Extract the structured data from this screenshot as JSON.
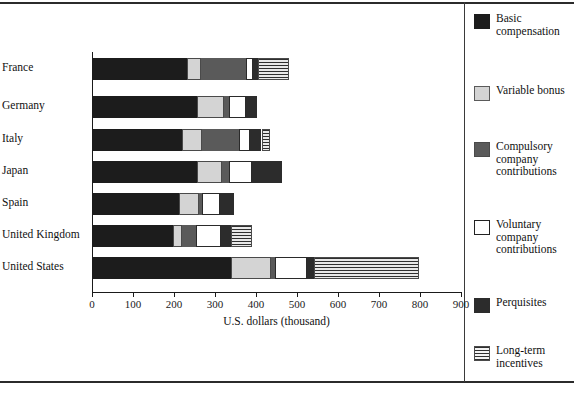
{
  "chart_data": {
    "type": "bar",
    "orientation": "horizontal",
    "stacked": true,
    "title": "",
    "xlabel": "U.S. dollars (thousand)",
    "ylabel": "",
    "xlim": [
      0,
      900
    ],
    "xticks": [
      0,
      100,
      200,
      300,
      400,
      500,
      600,
      700,
      800,
      900
    ],
    "grid": false,
    "legend_position": "right",
    "categories": [
      "France",
      "Germany",
      "Italy",
      "Japan",
      "Spain",
      "United Kingdom",
      "United States"
    ],
    "series": [
      {
        "name": "Basic compensation",
        "color": "#1c1c1c",
        "values": [
          230,
          254,
          218,
          254,
          210,
          196,
          337
        ]
      },
      {
        "name": "Variable bonus",
        "color": "#d4d4d4",
        "values": [
          34,
          66,
          49,
          61,
          49,
          22,
          98
        ]
      },
      {
        "name": "Compulsory company contributions",
        "color": "#5a5a5a",
        "values": [
          110,
          12,
          90,
          17,
          7,
          34,
          10
        ]
      },
      {
        "name": "Voluntary company contributions",
        "color": "#ffffff",
        "values": [
          17,
          42,
          25,
          57,
          44,
          61,
          76
        ]
      },
      {
        "name": "Perquisites",
        "color": "#2c2c2c",
        "values": [
          12,
          27,
          29,
          73,
          34,
          24,
          17
        ]
      },
      {
        "name": "Long-term incentives",
        "color": "#e8e8e8",
        "values": [
          76,
          0,
          20,
          0,
          0,
          52,
          257
        ]
      }
    ],
    "totals": [
      479,
      401,
      431,
      462,
      344,
      389,
      795
    ]
  },
  "axis": {
    "x_title": "U.S. dollars (thousand)",
    "tick_labels": [
      "0",
      "100",
      "200",
      "300",
      "400",
      "500",
      "600",
      "700",
      "800",
      "900"
    ]
  },
  "bars": [
    {
      "label": "France",
      "segments": [
        230,
        34,
        110,
        17,
        12,
        76
      ]
    },
    {
      "label": "Germany",
      "segments": [
        254,
        66,
        12,
        42,
        27,
        0
      ]
    },
    {
      "label": "Italy",
      "segments": [
        218,
        49,
        90,
        25,
        29,
        20
      ]
    },
    {
      "label": "Japan",
      "segments": [
        254,
        61,
        17,
        57,
        73,
        0
      ]
    },
    {
      "label": "Spain",
      "segments": [
        210,
        49,
        7,
        44,
        34,
        0
      ]
    },
    {
      "label": "United Kingdom",
      "segments": [
        196,
        22,
        34,
        61,
        24,
        52
      ]
    },
    {
      "label": "United States",
      "segments": [
        337,
        98,
        10,
        76,
        17,
        257
      ]
    }
  ],
  "legend": {
    "items": [
      {
        "label": "Basic compensation",
        "swatch": "basic",
        "color": "#1c1c1c"
      },
      {
        "label": "Variable bonus",
        "swatch": "bonus",
        "color": "#d4d4d4"
      },
      {
        "label": "Compulsory company contributions",
        "swatch": "compulsory",
        "color": "#5a5a5a"
      },
      {
        "label": "Voluntary company contributions",
        "swatch": "voluntary",
        "color": "#ffffff"
      },
      {
        "label": "Perquisites",
        "swatch": "perks",
        "color": "#2c2c2c"
      },
      {
        "label": "Long-term incentives",
        "swatch": "lti",
        "color": "#e8e8e8"
      }
    ]
  }
}
